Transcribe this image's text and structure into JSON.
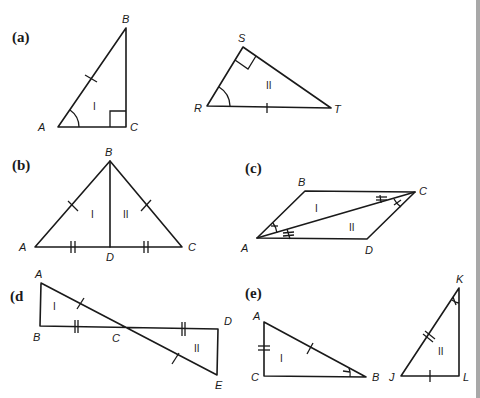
{
  "figure": {
    "panels": [
      {
        "id": "a",
        "label": "(a)",
        "triangles": [
          {
            "name": "I",
            "vertices": {
              "A": "A",
              "B": "B",
              "C": "C"
            },
            "marks": {
              "hypotenuse_AB": "single tick",
              "angle_A": "single arc",
              "angle_C": "right angle"
            }
          },
          {
            "name": "II",
            "vertices": {
              "R": "R",
              "S": "S",
              "T": "T"
            },
            "marks": {
              "side_RT": "single tick",
              "angle_R": "single arc",
              "angle_S": "right angle"
            }
          }
        ]
      },
      {
        "id": "b",
        "label": "(b)",
        "triangles": [
          {
            "name": "I",
            "vertices": {
              "A": "A",
              "B": "B",
              "D": "D"
            },
            "marks": {
              "AB": "single tick",
              "AD": "double tick"
            }
          },
          {
            "name": "II",
            "vertices": {
              "B": "B",
              "C": "C",
              "D": "D"
            },
            "marks": {
              "BC": "single tick",
              "DC": "double tick"
            }
          }
        ]
      },
      {
        "id": "c",
        "label": "(c)",
        "triangles": [
          {
            "name": "I",
            "vertices": {
              "A": "A",
              "B": "B",
              "C": "C"
            },
            "marks": {
              "angle_BAC": "single arc",
              "angle_BCA": "double-tick arc"
            }
          },
          {
            "name": "II",
            "vertices": {
              "A": "A",
              "C": "C",
              "D": "D"
            },
            "marks": {
              "angle_CAD": "double-tick arc",
              "angle_ACD": "single arc"
            }
          }
        ]
      },
      {
        "id": "d",
        "label": "(d",
        "triangles": [
          {
            "name": "I",
            "vertices": {
              "A": "A",
              "B": "B",
              "C": "C"
            },
            "marks": {
              "AC": "single tick",
              "BC": "double tick"
            }
          },
          {
            "name": "II",
            "vertices": {
              "C": "C",
              "D": "D",
              "E": "E"
            },
            "marks": {
              "CE": "single tick",
              "CD": "double tick"
            }
          }
        ]
      },
      {
        "id": "e",
        "label": "(e)",
        "triangles": [
          {
            "name": "I",
            "vertices": {
              "A": "A",
              "B": "B",
              "C": "C"
            },
            "marks": {
              "AC": "double tick",
              "AB": "single tick",
              "angle_B": "single arc"
            }
          },
          {
            "name": "II",
            "vertices": {
              "J": "J",
              "K": "K",
              "L": "L"
            },
            "marks": {
              "JK": "double tick",
              "JL": "single tick",
              "angle_K": "single arc"
            }
          }
        ]
      }
    ],
    "roman": {
      "one": "I",
      "two": "II"
    },
    "colors": {
      "ink": "#1a1a1a",
      "background": "#ffffff",
      "edge_strip": "#a8a8a8"
    }
  }
}
